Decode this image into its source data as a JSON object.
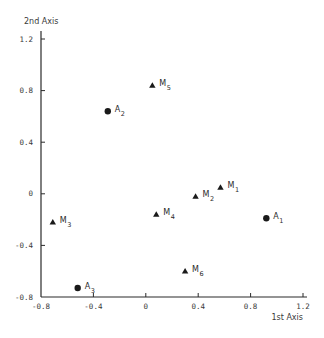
{
  "chart_data": {
    "type": "scatter",
    "title": "",
    "xlabel": "1st Axis",
    "ylabel": "2nd Axis",
    "xlim": [
      -0.8,
      1.2
    ],
    "ylim": [
      -0.8,
      1.2
    ],
    "grid": false,
    "legend": null,
    "x_ticks": [
      "-0.8",
      "-0.4",
      "0",
      "0.4",
      "0.8",
      "1.2"
    ],
    "y_ticks": [
      "-0.8",
      "-0.4",
      "0",
      "0.4",
      "0.8",
      "1.2"
    ],
    "series": [
      {
        "name": "A",
        "marker": "circle",
        "points": [
          {
            "label": "A",
            "sub": "1",
            "x": 0.92,
            "y": -0.19
          },
          {
            "label": "A",
            "sub": "2",
            "x": -0.29,
            "y": 0.64
          },
          {
            "label": "A",
            "sub": "3",
            "x": -0.52,
            "y": -0.73
          }
        ]
      },
      {
        "name": "M",
        "marker": "triangle",
        "points": [
          {
            "label": "M",
            "sub": "1",
            "x": 0.57,
            "y": 0.05
          },
          {
            "label": "M",
            "sub": "2",
            "x": 0.38,
            "y": -0.02
          },
          {
            "label": "M",
            "sub": "3",
            "x": -0.71,
            "y": -0.22
          },
          {
            "label": "M",
            "sub": "4",
            "x": 0.08,
            "y": -0.16
          },
          {
            "label": "M",
            "sub": "5",
            "x": 0.05,
            "y": 0.84
          },
          {
            "label": "M",
            "sub": "6",
            "x": 0.3,
            "y": -0.6
          }
        ]
      }
    ]
  },
  "colors": {
    "ink": "#1a1a1a",
    "axis": "#2a2a2a",
    "background": "#ffffff"
  }
}
